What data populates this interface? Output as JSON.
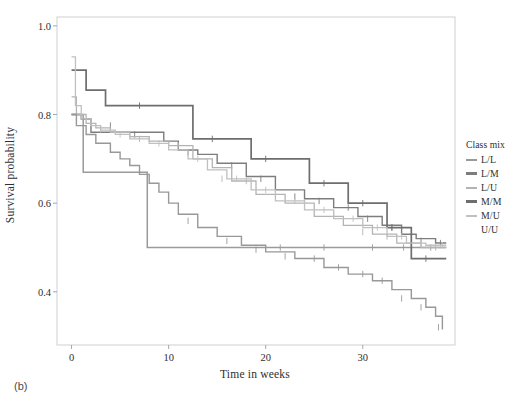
{
  "caption": "(b)",
  "legend": {
    "title": "Class mix",
    "items": [
      {
        "label": "L/L",
        "color": "#9a9a9a",
        "show_line": true
      },
      {
        "label": "L/M",
        "color": "#7d7d7d",
        "show_line": true
      },
      {
        "label": "L/U",
        "color": "#b4b4b4",
        "show_line": true
      },
      {
        "label": "M/M",
        "color": "#6e6e6e",
        "show_line": true
      },
      {
        "label": "M/U",
        "color": "#c0c0c0",
        "show_line": true
      },
      {
        "label": "U/U",
        "color": "#d8d8d8",
        "show_line": false
      }
    ]
  },
  "chart_data": {
    "type": "line",
    "title": "",
    "xlabel": "Time in weeks",
    "ylabel": "Survival probability",
    "xlim": [
      -1.5,
      39.5
    ],
    "ylim": [
      0.28,
      1.02
    ],
    "xticks": [
      0,
      10,
      20,
      30
    ],
    "xtick_labels": [
      "0",
      "10",
      "20",
      "30"
    ],
    "yticks": [
      0.4,
      0.6,
      0.8,
      1.0
    ],
    "ytick_labels": [
      "0.4",
      "0.6",
      "0.8",
      "1.0"
    ],
    "grid": false,
    "legend_position": "right",
    "step_style": "post",
    "series": [
      {
        "name": "L/L",
        "color": "#9a9a9a",
        "width": 1.5,
        "x": [
          0,
          0.6,
          1.2,
          7.2,
          7.8,
          38.6
        ],
        "y": [
          0.8,
          0.8,
          0.67,
          0.67,
          0.5,
          0.5
        ],
        "censor_x": [
          21.5,
          26.0,
          31.0,
          34.2,
          37.0
        ],
        "censor_y": [
          0.5,
          0.5,
          0.5,
          0.5,
          0.5
        ]
      },
      {
        "name": "L/M",
        "color": "#7d7d7d",
        "width": 1.4,
        "x": [
          0,
          1.0,
          2.0,
          9.5,
          11.0,
          13.0,
          15.0,
          18.0,
          21.0,
          24.0,
          27.0,
          29.5,
          32.0,
          34.0,
          35.5,
          37.5,
          38.6
        ],
        "y": [
          0.8,
          0.79,
          0.76,
          0.74,
          0.72,
          0.71,
          0.69,
          0.66,
          0.63,
          0.61,
          0.59,
          0.57,
          0.55,
          0.53,
          0.52,
          0.51,
          0.51
        ],
        "censor_x": [
          4.0,
          6.5,
          12.0,
          16.5,
          19.5,
          23.0,
          25.5,
          28.5,
          30.5,
          33.0,
          36.0,
          38.0
        ],
        "censor_y": [
          0.775,
          0.755,
          0.715,
          0.685,
          0.655,
          0.615,
          0.605,
          0.59,
          0.565,
          0.545,
          0.515,
          0.51
        ]
      },
      {
        "name": "L/U",
        "color": "#b4b4b4",
        "width": 1.3,
        "x": [
          0,
          0.5,
          1.5,
          2.5,
          4.0,
          6.0,
          8.0,
          10.0,
          12.5,
          14.5,
          16.5,
          19.0,
          22.0,
          25.0,
          28.0,
          31.0,
          33.5,
          36.0,
          38.6
        ],
        "y": [
          0.84,
          0.8,
          0.78,
          0.77,
          0.76,
          0.75,
          0.74,
          0.73,
          0.7,
          0.68,
          0.65,
          0.62,
          0.6,
          0.57,
          0.55,
          0.53,
          0.51,
          0.5,
          0.5
        ],
        "censor_x": [
          3.0,
          7.0,
          11.0,
          15.5,
          18.0,
          21.0,
          24.0,
          27.0,
          30.0,
          32.5,
          35.0,
          37.5
        ],
        "censor_y": [
          0.765,
          0.745,
          0.73,
          0.655,
          0.65,
          0.62,
          0.6,
          0.575,
          0.535,
          0.525,
          0.505,
          0.5
        ]
      },
      {
        "name": "M/M",
        "color": "#6e6e6e",
        "width": 1.7,
        "x": [
          0,
          1.0,
          1.5,
          3.0,
          3.5,
          11.5,
          12.5,
          17.5,
          18.5,
          23.5,
          24.5,
          27.5,
          28.5,
          31.5,
          32.5,
          34.0,
          35.0,
          38.6
        ],
        "y": [
          0.9,
          0.9,
          0.855,
          0.855,
          0.82,
          0.82,
          0.745,
          0.745,
          0.7,
          0.7,
          0.645,
          0.645,
          0.6,
          0.6,
          0.545,
          0.545,
          0.475,
          0.475
        ],
        "censor_x": [
          7.0,
          14.5,
          20.0,
          26.0,
          30.0,
          33.0,
          36.5
        ],
        "censor_y": [
          0.82,
          0.745,
          0.7,
          0.645,
          0.6,
          0.545,
          0.475
        ]
      },
      {
        "name": "M/U",
        "color": "#c0c0c0",
        "width": 1.3,
        "x": [
          0,
          0.4,
          1.0,
          2.0,
          3.0,
          4.5,
          6.0,
          8.0,
          10.0,
          12.0,
          14.0,
          16.0,
          18.5,
          21.0,
          24.0,
          27.0,
          30.0,
          32.5,
          34.5,
          36.5,
          38.6
        ],
        "y": [
          0.93,
          0.82,
          0.79,
          0.775,
          0.765,
          0.755,
          0.745,
          0.735,
          0.72,
          0.7,
          0.675,
          0.655,
          0.63,
          0.605,
          0.585,
          0.565,
          0.545,
          0.525,
          0.51,
          0.505,
          0.505
        ],
        "censor_x": [
          5.0,
          9.0,
          13.0,
          17.0,
          20.0,
          23.0,
          26.0,
          29.0,
          31.5,
          34.0,
          36.0,
          38.2
        ],
        "censor_y": [
          0.755,
          0.735,
          0.7,
          0.655,
          0.63,
          0.605,
          0.585,
          0.565,
          0.545,
          0.525,
          0.51,
          0.505
        ]
      },
      {
        "name": "U/U",
        "color": "#989898",
        "width": 1.4,
        "x": [
          0,
          0.5,
          1.5,
          2.5,
          4.0,
          5.0,
          6.0,
          7.0,
          8.0,
          9.0,
          10.0,
          11.0,
          13.0,
          15.0,
          17.5,
          20.0,
          23.0,
          26.0,
          28.5,
          31.0,
          33.0,
          35.0,
          36.5,
          37.5,
          38.2
        ],
        "y": [
          0.8,
          0.775,
          0.755,
          0.735,
          0.715,
          0.7,
          0.685,
          0.665,
          0.645,
          0.625,
          0.6,
          0.575,
          0.545,
          0.525,
          0.505,
          0.49,
          0.475,
          0.455,
          0.44,
          0.425,
          0.405,
          0.385,
          0.365,
          0.345,
          0.315
        ],
        "censor_x": [
          12.0,
          16.0,
          19.0,
          22.0,
          25.0,
          27.5,
          30.0,
          32.0,
          34.0,
          36.0,
          37.8
        ],
        "censor_y": [
          0.56,
          0.515,
          0.495,
          0.48,
          0.475,
          0.455,
          0.44,
          0.425,
          0.385,
          0.365,
          0.32
        ]
      }
    ]
  }
}
